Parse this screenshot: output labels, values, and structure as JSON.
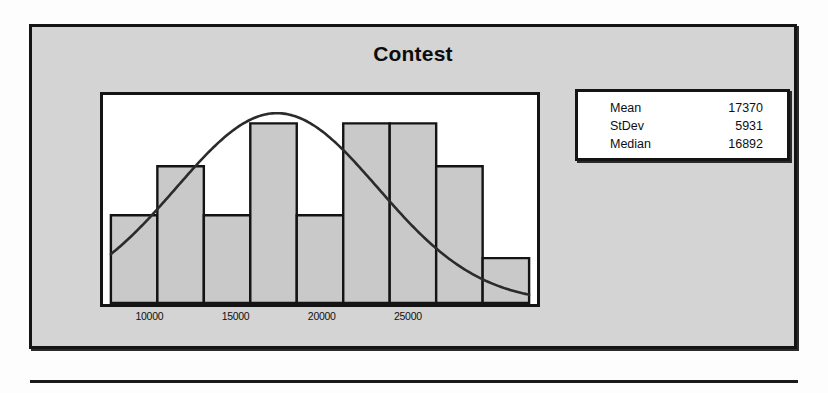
{
  "figure": {
    "title": "Contest"
  },
  "stats": {
    "rows": [
      {
        "label": "Mean",
        "value": "17370"
      },
      {
        "label": "StDev",
        "value": "5931"
      },
      {
        "label": "Median",
        "value": "16892"
      }
    ]
  },
  "chart_data": {
    "type": "bar",
    "title": "Contest",
    "xlabel": "",
    "ylabel": "",
    "grid": false,
    "legend": null,
    "xlim": [
      7600,
      32200
    ],
    "ylim": [
      0,
      10
    ],
    "xticks": [
      10000,
      15000,
      20000,
      25000
    ],
    "xtick_labels": [
      "10000",
      "15000",
      "20000",
      "25000"
    ],
    "bin_width": 2733,
    "bin_edges": [
      7600,
      10333,
      13067,
      15800,
      18533,
      21267,
      24000,
      26733,
      29467,
      32200
    ],
    "bin_centers": [
      8967,
      11700,
      14433,
      17167,
      19900,
      22633,
      25367,
      28100,
      30833
    ],
    "categories": [
      "8967",
      "11700",
      "14433",
      "17167",
      "19900",
      "22633",
      "25367",
      "28100",
      "30833"
    ],
    "values": [
      4.3,
      6.7,
      4.3,
      8.8,
      4.3,
      8.8,
      8.8,
      6.7,
      2.2
    ],
    "overlay": {
      "type": "line",
      "name": "normal curve",
      "mean": 17370,
      "stdev": 5931,
      "peak_value": 9.3
    }
  }
}
